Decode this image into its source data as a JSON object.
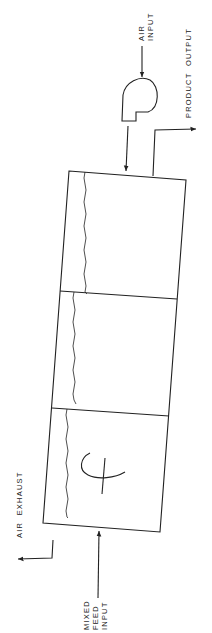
{
  "diagram": {
    "type": "process flow schematic (rotated 90°)",
    "colors": {
      "line": "#222222",
      "background": "#ffffff"
    },
    "labels": {
      "air_input": "AIR\nINPUT",
      "product_output": "PRODUCT  OUTPUT",
      "air_exhaust": "AIR  EXHAUST",
      "mixed_feed_input": "MIXED\nFEED\nINPUT"
    },
    "components": [
      {
        "id": "blower",
        "name": "air blower"
      },
      {
        "id": "vessel",
        "name": "three-chamber vessel",
        "chambers": 3
      },
      {
        "id": "agitator",
        "name": "agitator symbol in feed chamber"
      }
    ],
    "flows": [
      {
        "from": "air input",
        "to": "blower"
      },
      {
        "from": "blower",
        "to": "vessel"
      },
      {
        "from": "vessel",
        "to": "product output"
      },
      {
        "from": "mixed feed input",
        "to": "vessel"
      },
      {
        "from": "vessel",
        "to": "air exhaust"
      }
    ]
  }
}
